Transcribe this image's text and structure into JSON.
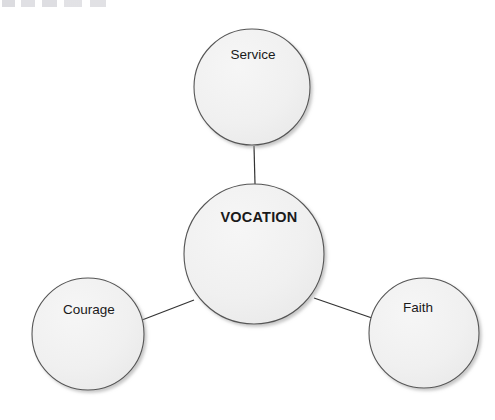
{
  "page": {
    "background_color": "#ffffff",
    "width": 495,
    "height": 420
  },
  "diagram": {
    "type": "radial-concept-map",
    "title_text": "VOCATION",
    "style": {
      "node_fill": "#f0f0f0",
      "node_stroke": "#555555",
      "connector_color": "#333333",
      "label_color": "#1a1a1a",
      "shadow_color": "#9a9a9a"
    },
    "center_node": {
      "label": "VOCATION",
      "weight": "bold",
      "cx": 254,
      "cy": 254,
      "r": 70,
      "label_x": 259,
      "label_y": 218
    },
    "satellite_nodes": [
      {
        "id": "service",
        "label": "Service",
        "weight": "regular",
        "cx": 252,
        "cy": 87,
        "r": 58,
        "label_x": 253,
        "label_y": 55
      },
      {
        "id": "courage",
        "label": "Courage",
        "weight": "regular",
        "cx": 88,
        "cy": 334,
        "r": 56,
        "label_x": 89,
        "label_y": 310
      },
      {
        "id": "faith",
        "label": "Faith",
        "weight": "regular",
        "cx": 424,
        "cy": 333,
        "r": 55,
        "label_x": 418,
        "label_y": 308
      }
    ],
    "connectors": [
      {
        "id": "vocation-service",
        "from": "vocation",
        "to": "service",
        "x1": 255,
        "y1": 184,
        "x2": 254,
        "y2": 146
      },
      {
        "id": "vocation-courage",
        "from": "vocation",
        "to": "courage",
        "x1": 194,
        "y1": 300,
        "x2": 142,
        "y2": 320
      },
      {
        "id": "vocation-faith",
        "from": "vocation",
        "to": "faith",
        "x1": 314,
        "y1": 298,
        "x2": 372,
        "y2": 318
      }
    ]
  },
  "artifact": {
    "name": "top-edge-scan-remnant",
    "description": "faint cropped text remnant along the top-left edge"
  }
}
